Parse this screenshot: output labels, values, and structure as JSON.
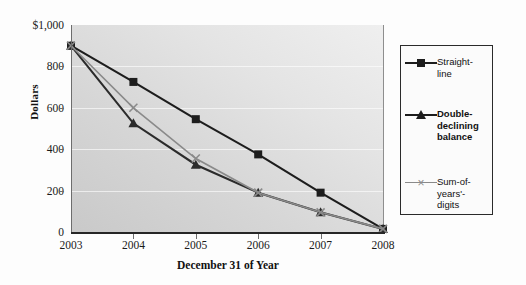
{
  "chart_data": {
    "type": "line",
    "title": "",
    "xlabel": "December 31 of Year",
    "ylabel": "Dollars",
    "categories": [
      "2003",
      "2004",
      "2005",
      "2006",
      "2007",
      "2008"
    ],
    "x_tick_labels": [
      "2003",
      "2004",
      "2005",
      "2006",
      "2007",
      "2008"
    ],
    "y_tick_labels": [
      "$1,000",
      "800",
      "600",
      "400",
      "200",
      "0"
    ],
    "y_tick_values": [
      1000,
      800,
      600,
      400,
      200,
      0
    ],
    "ylim": [
      0,
      1000
    ],
    "grid": true,
    "legend_position": "right",
    "series": [
      {
        "name": "Straight-line",
        "marker": "square",
        "color": "#1d1d1d",
        "values": [
          900,
          725,
          545,
          375,
          190,
          15
        ]
      },
      {
        "name": "Double-declining balance",
        "marker": "triangle",
        "color": "#2b2b2b",
        "values": [
          900,
          525,
          325,
          190,
          95,
          15
        ]
      },
      {
        "name": "Sum-of-years'-digits",
        "marker": "x",
        "color": "#8a8a8a",
        "values": [
          900,
          600,
          355,
          190,
          95,
          15
        ]
      }
    ]
  },
  "legend": {
    "entries": [
      {
        "label": "Straight-\nline",
        "marker": "square"
      },
      {
        "label": "Double-\ndeclining\nbalance",
        "marker": "triangle"
      },
      {
        "label": "Sum-of-\nyears'-\ndigits",
        "marker": "x"
      }
    ]
  },
  "colors": {
    "series_dark": "#1d1d1d",
    "series_gray": "#8a8a8a",
    "axis": "#262626",
    "plot_bg_light": "#efefef",
    "plot_bg_dark": "#c9c9c9",
    "legend_border": "#2b2b2b"
  }
}
